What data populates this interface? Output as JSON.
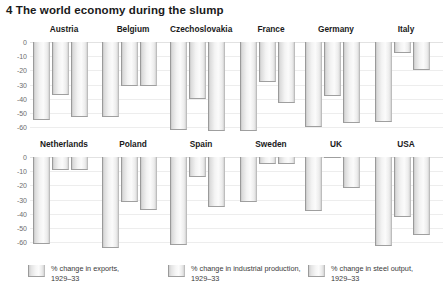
{
  "chart_data": {
    "type": "bar",
    "title": "4 The world economy during the slump",
    "xlabel": "",
    "ylabel": "",
    "ylim": [
      -65,
      0
    ],
    "yticks": [
      0,
      -10,
      -20,
      -30,
      -40,
      -50,
      -60
    ],
    "ytick_labels": [
      "0",
      "-10",
      "-20",
      "-30",
      "-40",
      "-50",
      "-60"
    ],
    "grid": true,
    "legend_position": "bottom",
    "categories": [
      "Austria",
      "Belgium",
      "Czechoslovakia",
      "France",
      "Germany",
      "Italy",
      "Netherlands",
      "Poland",
      "Spain",
      "Sweden",
      "UK",
      "USA"
    ],
    "series": [
      {
        "name": "% change in exports, 1929–33",
        "values": [
          -55,
          -53,
          -62,
          -63,
          -60,
          -56,
          -61,
          -64,
          -62,
          -32,
          -38,
          -63
        ]
      },
      {
        "name": "% change in industrial production, 1929–33",
        "values": [
          -37,
          -31,
          -40,
          -28,
          -38,
          -8,
          -9,
          -32,
          -14,
          -5,
          -1,
          -42
        ]
      },
      {
        "name": "% change in steel output, 1929–33",
        "values": [
          -53,
          -31,
          -63,
          -43,
          -57,
          -20,
          -9,
          -37,
          -35,
          -5,
          -22,
          -55
        ]
      }
    ],
    "panels": [
      {
        "name": "Austria",
        "row": 0,
        "bars": [
          {
            "series": "exports",
            "value": -55
          },
          {
            "series": "industrial production",
            "value": -37
          },
          {
            "series": "steel output",
            "value": -53
          }
        ]
      },
      {
        "name": "Belgium",
        "row": 0,
        "bars": [
          {
            "series": "exports",
            "value": -53
          },
          {
            "series": "industrial production",
            "value": -31
          },
          {
            "series": "steel output",
            "value": -31
          }
        ]
      },
      {
        "name": "Czechoslovakia",
        "row": 0,
        "bars": [
          {
            "series": "exports",
            "value": -62
          },
          {
            "series": "industrial production",
            "value": -40
          },
          {
            "series": "steel output",
            "value": -63
          }
        ]
      },
      {
        "name": "France",
        "row": 0,
        "bars": [
          {
            "series": "exports",
            "value": -63
          },
          {
            "series": "industrial production",
            "value": -28
          },
          {
            "series": "steel output",
            "value": -43
          }
        ]
      },
      {
        "name": "Germany",
        "row": 0,
        "bars": [
          {
            "series": "exports",
            "value": -60
          },
          {
            "series": "industrial production",
            "value": -38
          },
          {
            "series": "steel output",
            "value": -57
          }
        ]
      },
      {
        "name": "Italy",
        "row": 0,
        "bars": [
          {
            "series": "exports",
            "value": -56
          },
          {
            "series": "industrial production",
            "value": -8
          },
          {
            "series": "steel output",
            "value": -20
          }
        ]
      },
      {
        "name": "Netherlands",
        "row": 1,
        "bars": [
          {
            "series": "exports",
            "value": -61
          },
          {
            "series": "industrial production",
            "value": -9
          },
          {
            "series": "steel output",
            "value": -9
          }
        ]
      },
      {
        "name": "Poland",
        "row": 1,
        "bars": [
          {
            "series": "exports",
            "value": -64
          },
          {
            "series": "industrial production",
            "value": -32
          },
          {
            "series": "steel output",
            "value": -37
          }
        ]
      },
      {
        "name": "Spain",
        "row": 1,
        "bars": [
          {
            "series": "exports",
            "value": -62
          },
          {
            "series": "industrial production",
            "value": -14
          },
          {
            "series": "steel output",
            "value": -35
          }
        ]
      },
      {
        "name": "Sweden",
        "row": 1,
        "bars": [
          {
            "series": "exports",
            "value": -32
          },
          {
            "series": "industrial production",
            "value": -5
          },
          {
            "series": "steel output",
            "value": -5
          }
        ]
      },
      {
        "name": "UK",
        "row": 1,
        "bars": [
          {
            "series": "exports",
            "value": -38
          },
          {
            "series": "industrial production",
            "value": -1
          },
          {
            "series": "steel output",
            "value": -22
          }
        ]
      },
      {
        "name": "USA",
        "row": 1,
        "bars": [
          {
            "series": "exports",
            "value": -63
          },
          {
            "series": "industrial production",
            "value": -42
          },
          {
            "series": "steel output",
            "value": -55
          }
        ]
      }
    ],
    "legend": [
      {
        "line1": "% change in exports,",
        "line2": "1929–33"
      },
      {
        "line1": "% change in industrial production,",
        "line2": "1929–33"
      },
      {
        "line1": "% change in steel output,",
        "line2": "1929–33"
      }
    ]
  },
  "colors": {
    "bar_face": "#f3f3f3",
    "bar_edge": "#9a9a9a",
    "grid": "#ededed",
    "text": "#231f20",
    "tick_text": "#6d6d6d",
    "background": "#ffffff"
  }
}
